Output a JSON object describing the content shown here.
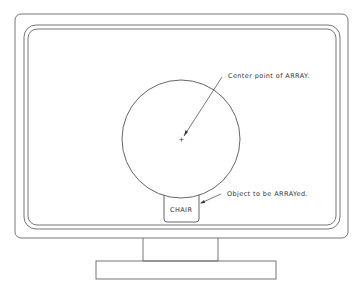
{
  "diagram": {
    "labels": {
      "center_point": "Center point of ARRAY.",
      "object": "Object to be ARRAYed.",
      "chair": "CHAIR"
    },
    "center_marker": "+",
    "stroke_color": "#555555"
  }
}
